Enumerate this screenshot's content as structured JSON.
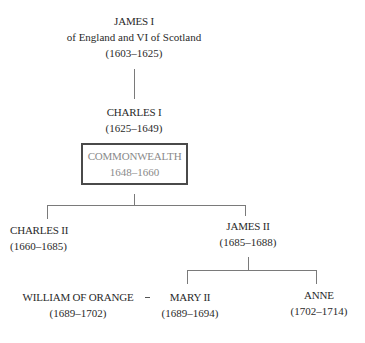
{
  "nodes": {
    "james1": {
      "name": "JAMES I",
      "subtitle": "of England  and VI of Scotland",
      "dates": "(1603–1625)"
    },
    "charles1": {
      "name": "CHARLES I",
      "dates": "(1625–1649)"
    },
    "commonwealth": {
      "name": "COMMONWEALTH",
      "dates": "1648–1660"
    },
    "charles2": {
      "name": "CHARLES II",
      "dates": "(1660–1685)"
    },
    "james2": {
      "name": "JAMES II",
      "dates": "(1685–1688)"
    },
    "william": {
      "name": "WILLIAM OF ORANGE",
      "dates": "(1689–1702)"
    },
    "mary2": {
      "name": "MARY II",
      "dates": "(1689–1694)"
    },
    "anne": {
      "name": "ANNE",
      "dates": "(1702–1714)"
    }
  },
  "relations": {
    "marriage_symbol": "="
  },
  "colors": {
    "text": "#2a2a2a",
    "commonwealth_text": "#8a8a8a",
    "lines": "#7a7a7a",
    "box_border": "#4a4a4a"
  }
}
